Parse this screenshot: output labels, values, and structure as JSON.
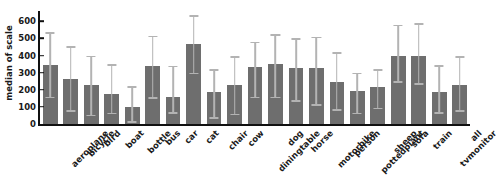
{
  "chart_data": {
    "type": "bar",
    "title": "",
    "xlabel": "",
    "ylabel": "median of scale",
    "ylim": [
      0,
      660
    ],
    "grid": false,
    "legend": null,
    "yticks": [
      0,
      100,
      200,
      300,
      400,
      500,
      600
    ],
    "ytick_labels": [
      "0",
      "100",
      "200",
      "300",
      "400",
      "500",
      "600"
    ],
    "error_bars": "vertical whiskers with caps (lower and upper quartiles)",
    "bar_color": "#6e6e6e",
    "error_color": "#b3b3b3",
    "axis_color": "#111111",
    "categories": [
      "aeroplane",
      "bicycle",
      "bird",
      "boat",
      "bottle",
      "bus",
      "car",
      "cat",
      "chair",
      "cow",
      "diningtable",
      "dog",
      "horse",
      "motorbike",
      "person",
      "pottedplant",
      "sheep",
      "sofa",
      "train",
      "tvmonitor",
      "all"
    ],
    "values": [
      345,
      265,
      225,
      175,
      100,
      340,
      155,
      465,
      185,
      225,
      335,
      350,
      330,
      330,
      245,
      190,
      215,
      395,
      400,
      185,
      230
    ],
    "err_low": [
      160,
      80,
      55,
      65,
      15,
      155,
      70,
      300,
      40,
      60,
      160,
      160,
      140,
      115,
      85,
      65,
      95,
      250,
      240,
      70,
      80
    ],
    "err_high": [
      535,
      455,
      400,
      350,
      220,
      515,
      340,
      635,
      320,
      395,
      480,
      525,
      500,
      510,
      420,
      300,
      320,
      580,
      590,
      345,
      395
    ]
  },
  "axis": {
    "ylabel": "median of scale"
  }
}
